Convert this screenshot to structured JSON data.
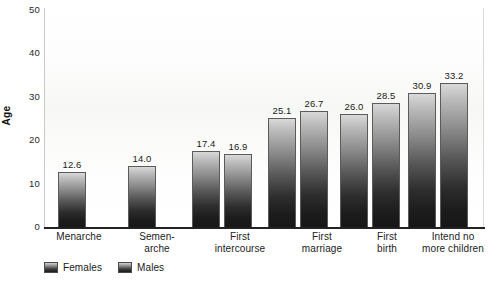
{
  "chart_data": {
    "type": "bar",
    "title": "",
    "xlabel": "",
    "ylabel": "Age",
    "ylim": [
      0,
      50
    ],
    "yticks": [
      0,
      10,
      20,
      30,
      40,
      50
    ],
    "grid": false,
    "legend_position": "bottom-left",
    "categories": [
      "Menarche",
      "Semen-\narche",
      "First\nintercourse",
      "First\nmarriage",
      "First\nbirth",
      "Intend no\nmore children"
    ],
    "series": [
      {
        "name": "Females",
        "color": "#3b3b3b",
        "values": [
          12.6,
          null,
          17.4,
          25.1,
          26.0,
          30.9
        ],
        "labels": [
          "12.6",
          "",
          "17.4",
          "25.1",
          "26.0",
          "30.9"
        ]
      },
      {
        "name": "Males",
        "color": "#3b3b3b",
        "values": [
          null,
          14.0,
          16.9,
          26.7,
          28.5,
          33.2
        ],
        "labels": [
          "",
          "14.0",
          "16.9",
          "26.7",
          "28.5",
          "33.2"
        ]
      }
    ]
  },
  "legend": {
    "items": [
      {
        "label": "Females"
      },
      {
        "label": "Males"
      }
    ]
  },
  "axis": {
    "y_label": "Age",
    "y_ticks": [
      "50",
      "40",
      "30",
      "20",
      "10",
      "0"
    ]
  }
}
